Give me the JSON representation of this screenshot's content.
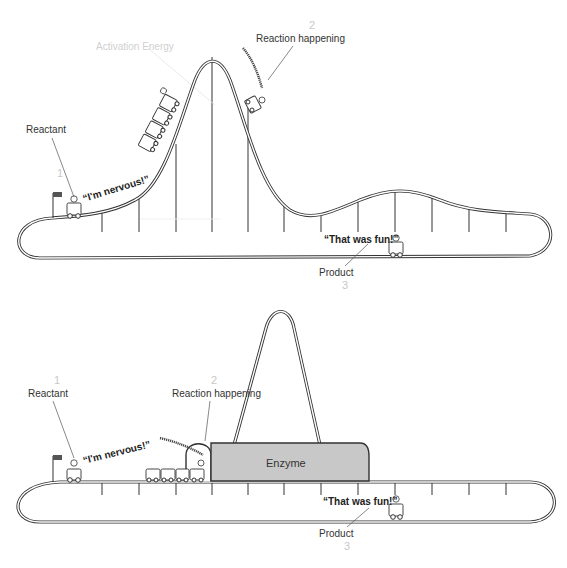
{
  "top_diagram": {
    "title": "Reaction without enzyme",
    "labels": {
      "reactant": "Reactant",
      "reactant_step": "1",
      "activation_energy": "Activation Energy",
      "reaction": "Reaction happening",
      "reaction_step": "2",
      "product": "Product",
      "product_step": "3"
    },
    "quotes": {
      "nervous": "“I'm nervous!”",
      "fun": "“That was fun!”"
    }
  },
  "bottom_diagram": {
    "title": "Reaction with enzyme",
    "labels": {
      "reactant": "Reactant",
      "reactant_step": "1",
      "reaction": "Reaction happening",
      "reaction_step": "2",
      "enzyme": "Enzyme",
      "product": "Product",
      "product_step": "3"
    },
    "quotes": {
      "nervous": "“I'm nervous!”",
      "fun": "“That was fun!”"
    }
  },
  "colors": {
    "track": "#333333",
    "enzyme_fill": "#c8c8c8",
    "step_number": "#c8c8c8",
    "activation_label": "#d0d0d0"
  }
}
